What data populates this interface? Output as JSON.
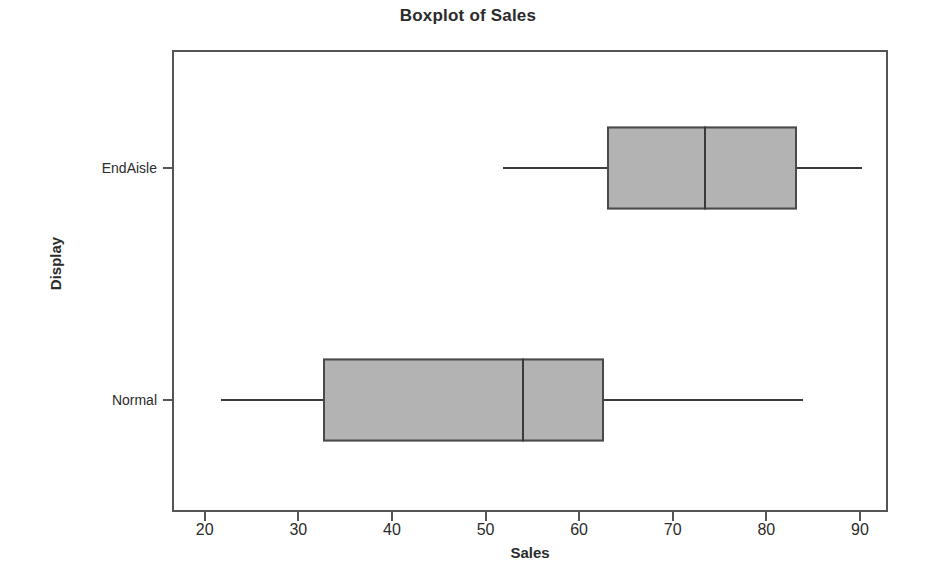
{
  "chart_data": {
    "type": "box",
    "title": "Boxplot of Sales",
    "xlabel": "Sales",
    "ylabel": "Display",
    "orientation": "horizontal",
    "xlim": [
      16.5,
      93.0
    ],
    "xticks": [
      20,
      30,
      40,
      50,
      60,
      70,
      80,
      90
    ],
    "xticklabels": [
      "20",
      "30",
      "40",
      "50",
      "60",
      "70",
      "80",
      "90"
    ],
    "categories": [
      "EndAisle",
      "Normal"
    ],
    "grid": false,
    "legend": null,
    "box_fill_color": "#b3b3b3",
    "box_line_color": "#4a4a4a",
    "frame_color": "#555555",
    "boxes": [
      {
        "category": "EndAisle",
        "whisker_low": 51.9,
        "q1": 63.0,
        "median": 73.4,
        "q3": 83.3,
        "whisker_high": 90.2
      },
      {
        "category": "Normal",
        "whisker_low": 21.7,
        "q1": 32.6,
        "median": 54.0,
        "q3": 62.7,
        "whisker_high": 83.9
      }
    ]
  }
}
